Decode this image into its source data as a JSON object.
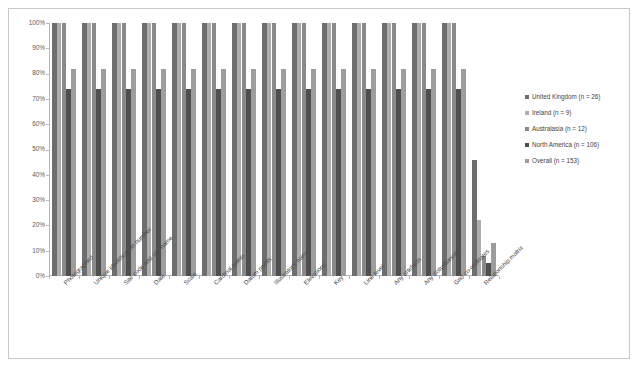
{
  "chart_data": {
    "type": "bar",
    "title": "",
    "subtitle": "",
    "xlabel": "",
    "ylabel": "",
    "ylim": [
      0,
      100
    ],
    "y_unit": "%",
    "grid": false,
    "legend_position": "right",
    "ytick_labels": [
      "100%",
      "90%",
      "80%",
      "70%",
      "60%",
      "50%",
      "40%",
      "30%",
      "20%",
      "10%",
      "0%"
    ],
    "ytick_values": [
      100,
      90,
      80,
      70,
      60,
      50,
      40,
      30,
      20,
      10,
      0
    ],
    "categories": [
      "Photographed",
      "Unique identification number",
      "Site code and site name",
      "Date",
      "Scale",
      "Cardinal points",
      "Datum points",
      "Illustrator's name",
      "Elevations",
      "Key",
      "Line level",
      "Any artefacts",
      "Any disturbances",
      "Grid co-ordinates",
      "Relationship matrix"
    ],
    "series": [
      {
        "name": "United Kingdom (n = 26)",
        "color": "#6e6e6e",
        "values": [
          100,
          100,
          100,
          100,
          100,
          100,
          100,
          100,
          100,
          100,
          100,
          100,
          100,
          100,
          46
        ]
      },
      {
        "name": "Ireland (n = 9)",
        "color": "#adadad",
        "values": [
          100,
          100,
          100,
          100,
          100,
          100,
          100,
          100,
          100,
          100,
          100,
          100,
          100,
          100,
          22
        ]
      },
      {
        "name": "Australasia (n = 12)",
        "color": "#8a8a8a",
        "values": [
          100,
          100,
          100,
          100,
          100,
          100,
          100,
          100,
          100,
          100,
          100,
          100,
          100,
          100,
          8
        ]
      },
      {
        "name": "North America (n = 106)",
        "color": "#4f4f4f",
        "values": [
          74,
          74,
          74,
          74,
          74,
          74,
          74,
          74,
          74,
          74,
          74,
          74,
          74,
          74,
          5
        ]
      },
      {
        "name": "Overall (n = 153)",
        "color": "#9d9d9d",
        "values": [
          82,
          82,
          82,
          82,
          82,
          82,
          82,
          82,
          82,
          82,
          82,
          82,
          82,
          82,
          13
        ]
      }
    ]
  },
  "legend": {
    "items": [
      {
        "label": "United Kingdom (n = 26)",
        "color": "#6e6e6e"
      },
      {
        "label": "Ireland (n = 9)",
        "color": "#adadad"
      },
      {
        "label": "Australasia (n = 12)",
        "color": "#8a8a8a"
      },
      {
        "label": "North America (n = 106)",
        "color": "#4f4f4f"
      },
      {
        "label": "Overall (n = 153)",
        "color": "#9d9d9d"
      }
    ]
  }
}
